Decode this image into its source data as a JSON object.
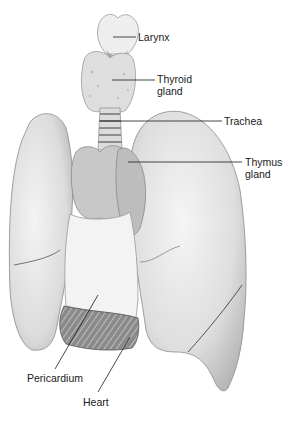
{
  "figure": {
    "colors": {
      "background": "#ffffff",
      "tissue_light": "#ececec",
      "tissue_mid": "#d2d2d2",
      "tissue_dark": "#9a9a9a",
      "thymus": "#bdbdbd",
      "outline": "#6e6e6e",
      "leader_line": "#1a1a1a",
      "label_text": "#1a1a1a"
    },
    "labels": [
      {
        "id": "larynx",
        "line1": "Larynx",
        "line2": ""
      },
      {
        "id": "thyroid",
        "line1": "Thyroid",
        "line2": "gland"
      },
      {
        "id": "trachea",
        "line1": "Trachea",
        "line2": ""
      },
      {
        "id": "thymus",
        "line1": "Thymus",
        "line2": "gland"
      },
      {
        "id": "pericardium",
        "line1": "Pericardium",
        "line2": ""
      },
      {
        "id": "heart",
        "line1": "Heart",
        "line2": ""
      }
    ]
  }
}
